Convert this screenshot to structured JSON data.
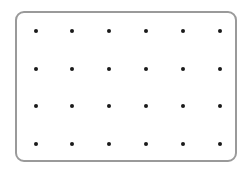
{
  "grid": {
    "rows": 4,
    "columns": 6,
    "dot_color": "#1a1a1a",
    "border_color": "#9a9a9a",
    "x_positions": [
      36,
      72,
      109,
      146,
      183,
      220
    ],
    "y_positions": [
      31,
      69,
      106,
      144
    ]
  }
}
